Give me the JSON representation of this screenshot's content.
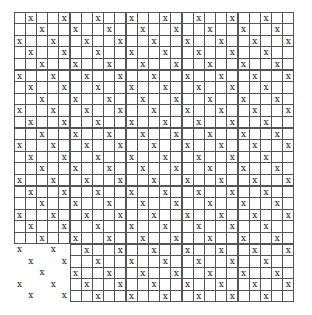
{
  "puzzle": {
    "rows": 25,
    "cols": 25,
    "mark": "x",
    "ungridded_region": {
      "row_start": 20,
      "row_end": 24,
      "col_start": 0,
      "col_end": 4
    },
    "cells": [
      ".x..x..x..x..x..x..x..x..",
      "..x..x..x..x..x..x..x..x.",
      "x..x..x..x..x..x..x..x..x",
      ".x..x..x..x..x..x..x..x..",
      "..x..x..x..x..x..x..x..x.",
      "x..x..x..x..x..x..x..x..x",
      ".x..x..x..x..x..x..x..x..",
      "..x..x..x..x..x..x..x..x.",
      "x..x..x..x..x..x..x..x..x",
      ".x..x..x..x..x..x..x..x..",
      "..x..x..x..x..x..x..x..x.",
      "x..x..x..x..x..x..x..x..x",
      ".x..x..x..x..x..x..x..x..",
      "..x..x..x..x..x..x..x..x.",
      "x..x..x..x..x..x..x..x..x",
      ".x..x..x..x..x..x..x..x..",
      "..x..x..x..x..x..x..x..x.",
      "x..x..x..x..x..x..x..x..x",
      ".x..x..x..x..x..x..x..x..",
      "..x..x..x..x..x..x..x..x.",
      "x..x..x..x..x..x..x..x..x",
      ".x..x..x..x..x..x..x..x..",
      "..x..x..x..x..x..x..x..x.",
      "x..x..x..x..x..x..x..x..x",
      ".x..x..x..x..x..x..x..x.."
    ]
  }
}
